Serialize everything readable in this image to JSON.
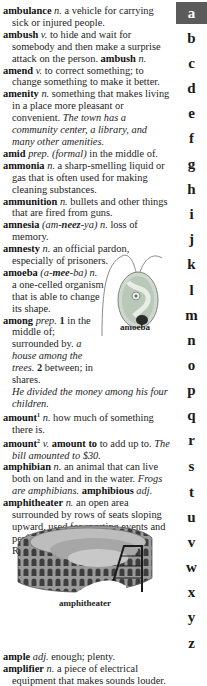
{
  "entries": {
    "ambulance": {
      "hw": "ambulance",
      "pos": "n.",
      "def": "a vehicle for carrying sick or injured people."
    },
    "ambush": {
      "hw": "ambush",
      "pos": "v.",
      "def": "to hide and wait for somebody and then make a surprise attack on the person.",
      "deriv": "ambush",
      "deriv_pos": "n."
    },
    "amend": {
      "hw": "amend",
      "pos": "v.",
      "def": "to correct something; to change something to make it better."
    },
    "amenity": {
      "hw": "amenity",
      "pos": "n.",
      "def": "something that makes living in a place more pleasant or convenient.",
      "ex": "The town has a community center, a library, and many other amenities."
    },
    "amid": {
      "hw": "amid",
      "pos": "prep.",
      "label": "(formal)",
      "def": "in the middle of."
    },
    "ammonia": {
      "hw": "ammonia",
      "pos": "n.",
      "def": "a sharp-smelling liquid or gas that is often used for making cleaning substances."
    },
    "ammunition": {
      "hw": "ammunition",
      "pos": "n.",
      "def": "bullets and other things that are fired from guns."
    },
    "amnesia": {
      "hw": "amnesia",
      "pron_a": "(am-",
      "pron_b": "neez",
      "pron_c": "-ya)",
      "pos": "n.",
      "def": "loss of memory."
    },
    "amnesty": {
      "hw": "amnesty",
      "pos": "n.",
      "def": "an official pardon, especially of prisoners."
    },
    "amoeba": {
      "hw": "amoeba",
      "pron_a": "(a-",
      "pron_b": "mee",
      "pron_c": "-ba)",
      "pos": "n.",
      "def": "a one-celled organism that is able to change its shape."
    },
    "among": {
      "hw": "among",
      "pos": "prep.",
      "sense1": "1",
      "def1": "in the middle of; surrounded by.",
      "ex1": "a house among the trees.",
      "sense2": "2",
      "def2": "between; in shares.",
      "ex2": "He divided the money among his four children."
    },
    "amount1": {
      "hw": "amount",
      "sup": "1",
      "pos": "n.",
      "def": "how much of something there is."
    },
    "amount2": {
      "hw": "amount",
      "sup": "2",
      "pos": "v.",
      "phrase": "amount to",
      "def": "to add up to.",
      "ex": "The bill amounted to $30."
    },
    "amphibian": {
      "hw": "amphibian",
      "pos": "n.",
      "def": "an animal that can live both on land and in the water.",
      "ex": "Frogs are amphibians.",
      "deriv": "amphibious",
      "deriv_pos": "adj."
    },
    "amphitheater": {
      "hw": "amphitheater",
      "pos": "n.",
      "def": "an open area surrounded by rows of seats sloping upward, used for sporting events and performing plays, especially in Roman times."
    },
    "ample": {
      "hw": "ample",
      "pos": "adj.",
      "def": "enough; plenty."
    },
    "amplifier": {
      "hw": "amplifier",
      "pos": "n.",
      "def": "a piece of electrical equipment that makes sounds louder."
    }
  },
  "figures": {
    "amoeba_caption": "amoeba",
    "amphitheater_caption": "amphitheater"
  },
  "tabs": {
    "active": "a",
    "active_color": "#5b5b5b",
    "letters": [
      "a",
      "b",
      "c",
      "d",
      "e",
      "f",
      "g",
      "h",
      "i",
      "j",
      "k",
      "l",
      "m",
      "n",
      "o",
      "p",
      "q",
      "r",
      "s",
      "t",
      "u",
      "v",
      "w",
      "x",
      "y",
      "z"
    ]
  }
}
